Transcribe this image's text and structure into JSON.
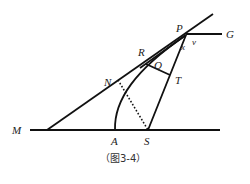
{
  "caption": "（图3-4）",
  "labels": {
    "M": "M",
    "A": "A",
    "S": "S",
    "N": "N",
    "R": "R",
    "Q": "Q",
    "T": "T",
    "P": "P",
    "G": "G",
    "v": "v",
    "x": "x"
  }
}
